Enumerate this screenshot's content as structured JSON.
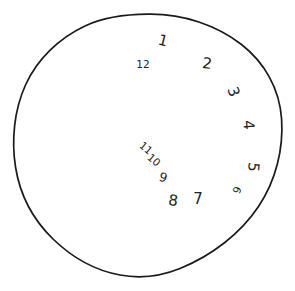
{
  "drawing": {
    "title": "hand-drawn clock face",
    "background_color": "#ffffff",
    "ink_color": "#1a1a1a",
    "circle": {
      "label": "clock-face-circle",
      "center_x": 148,
      "center_y": 145,
      "radius_x": 134,
      "radius_y": 131
    },
    "hands": [],
    "numerals": [
      {
        "label": "1",
        "x": 163,
        "y": 41,
        "rotation": 14,
        "size": "normal"
      },
      {
        "label": "12",
        "x": 143,
        "y": 64,
        "rotation": 0,
        "size": "tiny"
      },
      {
        "label": "2",
        "x": 207,
        "y": 64,
        "rotation": 8,
        "size": "normal"
      },
      {
        "label": "3",
        "x": 233,
        "y": 92,
        "rotation": 72,
        "size": "normal"
      },
      {
        "label": "4",
        "x": 248,
        "y": 125,
        "rotation": 86,
        "size": "normal"
      },
      {
        "label": "5",
        "x": 253,
        "y": 167,
        "rotation": 96,
        "size": "normal"
      },
      {
        "label": "6",
        "x": 237,
        "y": 190,
        "rotation": 112,
        "size": "tiny"
      },
      {
        "label": "7",
        "x": 198,
        "y": 199,
        "rotation": 0,
        "size": "normal"
      },
      {
        "label": "8",
        "x": 173,
        "y": 201,
        "rotation": 8,
        "size": "normal"
      },
      {
        "label": "9",
        "x": 163,
        "y": 178,
        "rotation": 16,
        "size": "small"
      },
      {
        "label": "10",
        "x": 154,
        "y": 160,
        "rotation": 40,
        "size": "tiny"
      },
      {
        "label": "11",
        "x": 146,
        "y": 148,
        "rotation": 40,
        "size": "tiny"
      }
    ]
  }
}
